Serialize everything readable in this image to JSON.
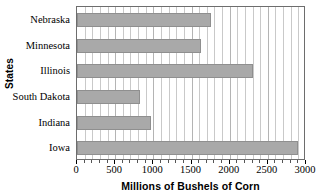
{
  "chart_data": {
    "type": "bar",
    "orientation": "horizontal",
    "title": "",
    "xlabel": "Millions of Bushels of Corn",
    "ylabel": "States",
    "categories": [
      "Nebraska",
      "Minnesota",
      "Illinois",
      "South Dakota",
      "Indiana",
      "Iowa"
    ],
    "values": [
      1750,
      1630,
      2300,
      830,
      970,
      2900
    ],
    "xlim": [
      0,
      3000
    ],
    "xticks": [
      0,
      500,
      1000,
      1500,
      2000,
      2500,
      3000
    ],
    "xticklabels": [
      "0",
      "500",
      "1000",
      "1500",
      "2000",
      "2500",
      "3000"
    ],
    "minor_tick_interval": 100,
    "grid": true,
    "grid_axis": "x",
    "legend": null,
    "bar_color": "#a9a9a9",
    "bar_edge_color": "#8f8f8f",
    "frame_color": "#6d6d6d",
    "grid_color": "#c9c9c9",
    "background_color": "#ffffff"
  }
}
